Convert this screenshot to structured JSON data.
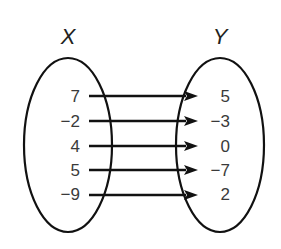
{
  "diagram": {
    "type": "mapping",
    "domain_set": {
      "label": "X",
      "values": [
        "7",
        "−2",
        "4",
        "5",
        "−9"
      ]
    },
    "range_set": {
      "label": "Y",
      "values": [
        "5",
        "−3",
        "0",
        "−7",
        "2"
      ]
    },
    "mappings": [
      {
        "from": "7",
        "to": "5"
      },
      {
        "from": "−2",
        "to": "−3"
      },
      {
        "from": "4",
        "to": "0"
      },
      {
        "from": "5",
        "to": "−7"
      },
      {
        "from": "−9",
        "to": "2"
      }
    ],
    "colors": {
      "stroke": "#111111",
      "text": "#3a3a3a",
      "background": "#ffffff"
    }
  }
}
